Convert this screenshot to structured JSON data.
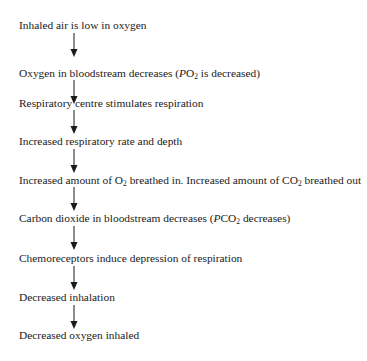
{
  "diagram": {
    "type": "flowchart",
    "direction": "top-to-bottom",
    "arrow_color": "#1a1a1a",
    "text_color": "#1a1a1a",
    "background": "#ffffff",
    "steps": [
      {
        "text": "Inhaled air is low in oxygen"
      },
      {
        "pre": "Oxygen in bloodstream decreases (",
        "italic": "P",
        "chem": "O",
        "sub": "2",
        "post": " is decreased)"
      },
      {
        "text": "Respiratory centre stimulates respiration"
      },
      {
        "text": "Increased respiratory rate and depth"
      },
      {
        "pre": "Increased amount of O",
        "sub": "2",
        "mid": " breathed in. Increased amount of CO",
        "sub2": "2",
        "post": " breathed out"
      },
      {
        "pre": "Carbon dioxide in bloodstream decreases (",
        "italic": "P",
        "chem": "CO",
        "sub": "2",
        "post": " decreases)"
      },
      {
        "text": "Chemoreceptors induce depression of respiration"
      },
      {
        "text": "Decreased inhalation"
      },
      {
        "text": "Decreased oxygen inhaled"
      }
    ],
    "arrows": [
      {
        "from": 0,
        "to": 1
      },
      {
        "from": 1,
        "to": 2
      },
      {
        "from": 2,
        "to": 3
      },
      {
        "from": 3,
        "to": 4
      },
      {
        "from": 4,
        "to": 5
      },
      {
        "from": 5,
        "to": 6
      },
      {
        "from": 6,
        "to": 7
      },
      {
        "from": 7,
        "to": 8
      }
    ]
  }
}
